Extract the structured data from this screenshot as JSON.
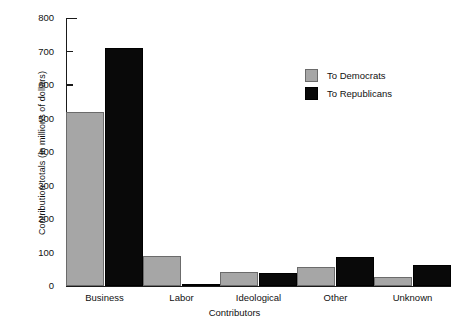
{
  "chart_data": {
    "type": "bar",
    "title": "",
    "xlabel": "Contributors",
    "ylabel": "Contribution totals (in millions of dollars)",
    "categories": [
      "Business",
      "Labor",
      "Ideological",
      "Other",
      "Unknown"
    ],
    "series": [
      {
        "name": "To Democrats",
        "color": "#a6a6a6",
        "values": [
          520,
          90,
          42,
          58,
          28
        ]
      },
      {
        "name": "To Republicans",
        "color": "#090909",
        "values": [
          710,
          5,
          40,
          88,
          62
        ]
      }
    ],
    "ylim": [
      0,
      800
    ],
    "yticks": [
      0,
      100,
      200,
      300,
      400,
      500,
      600,
      700,
      800
    ],
    "ytick_labels": [
      "0",
      "100",
      "200",
      "300",
      "400",
      "500",
      "600",
      "700",
      "800"
    ],
    "grid": false,
    "legend_position": "upper right",
    "legend_entries": [
      "To Democrats",
      "To Republicans"
    ]
  }
}
